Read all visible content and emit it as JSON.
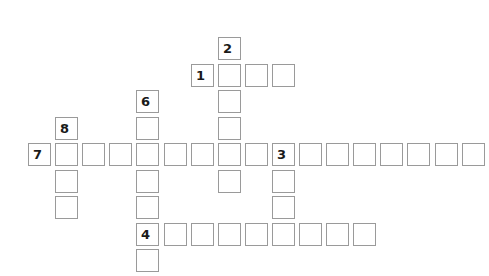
{
  "puzzle": {
    "origin": {
      "x": 28,
      "y": 37
    },
    "pitch": {
      "x": 27.1,
      "y": 26.5
    },
    "border_color": "#9a9a9a",
    "number_color": "#1a1a1a",
    "words": [
      {
        "number": "1",
        "direction": "across",
        "row": 1,
        "col": 6,
        "length": 4
      },
      {
        "number": "2",
        "direction": "down",
        "row": 0,
        "col": 7,
        "length": 6
      },
      {
        "number": "3",
        "direction": "across",
        "row": 4,
        "col": 9,
        "length": 8
      },
      {
        "number": "3",
        "direction": "down",
        "row": 4,
        "col": 9,
        "length": 3
      },
      {
        "number": "4",
        "direction": "across",
        "row": 7,
        "col": 4,
        "length": 9
      },
      {
        "number": "6",
        "direction": "down",
        "row": 2,
        "col": 4,
        "length": 7
      },
      {
        "number": "7",
        "direction": "across",
        "row": 4,
        "col": 0,
        "length": 9
      },
      {
        "number": "8",
        "direction": "down",
        "row": 3,
        "col": 1,
        "length": 4
      }
    ]
  }
}
